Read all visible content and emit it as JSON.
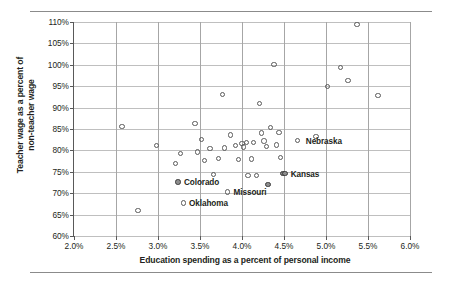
{
  "chart_data": {
    "type": "scatter",
    "title": "",
    "xlabel": "Education spending as a percent of personal income",
    "ylabel": "Teacher wage as a percent of\nnon-teacher wage",
    "xlim": [
      2.0,
      6.0
    ],
    "ylim": [
      60,
      110
    ],
    "xticks": [
      "2.0%",
      "2.5%",
      "3.0%",
      "3.5%",
      "4.0%",
      "4.5%",
      "5.0%",
      "5.5%",
      "6.0%"
    ],
    "xtick_values": [
      2.0,
      2.5,
      3.0,
      3.5,
      4.0,
      4.5,
      5.0,
      5.5,
      6.0
    ],
    "yticks": [
      "60%",
      "65%",
      "70%",
      "75%",
      "80%",
      "85%",
      "90%",
      "95%",
      "100%",
      "105%",
      "110%"
    ],
    "ytick_values": [
      60,
      65,
      70,
      75,
      80,
      85,
      90,
      95,
      100,
      105,
      110
    ],
    "grid": "both",
    "legend": "none",
    "marker": "open-circle",
    "points": [
      {
        "x": 2.57,
        "y": 85.6
      },
      {
        "x": 2.76,
        "y": 65.9
      },
      {
        "x": 2.98,
        "y": 81.2
      },
      {
        "x": 3.21,
        "y": 76.9
      },
      {
        "x": 3.24,
        "y": 72.6,
        "highlight": true
      },
      {
        "x": 3.27,
        "y": 79.3
      },
      {
        "x": 3.3,
        "y": 67.7
      },
      {
        "x": 3.44,
        "y": 86.3
      },
      {
        "x": 3.47,
        "y": 79.6
      },
      {
        "x": 3.52,
        "y": 82.6
      },
      {
        "x": 3.55,
        "y": 77.6
      },
      {
        "x": 3.62,
        "y": 80.4
      },
      {
        "x": 3.66,
        "y": 74.3
      },
      {
        "x": 3.72,
        "y": 78.1
      },
      {
        "x": 3.77,
        "y": 93.0
      },
      {
        "x": 3.79,
        "y": 80.6
      },
      {
        "x": 3.83,
        "y": 70.3
      },
      {
        "x": 3.86,
        "y": 83.6
      },
      {
        "x": 3.92,
        "y": 81.1
      },
      {
        "x": 3.96,
        "y": 77.9
      },
      {
        "x": 4.0,
        "y": 81.6
      },
      {
        "x": 4.02,
        "y": 80.8
      },
      {
        "x": 4.05,
        "y": 81.9
      },
      {
        "x": 4.07,
        "y": 74.1
      },
      {
        "x": 4.11,
        "y": 78.0
      },
      {
        "x": 4.14,
        "y": 81.8
      },
      {
        "x": 4.17,
        "y": 74.2
      },
      {
        "x": 4.21,
        "y": 91.0
      },
      {
        "x": 4.23,
        "y": 84.1
      },
      {
        "x": 4.26,
        "y": 82.2
      },
      {
        "x": 4.29,
        "y": 80.9
      },
      {
        "x": 4.31,
        "y": 72.0,
        "highlight": true
      },
      {
        "x": 4.34,
        "y": 85.4
      },
      {
        "x": 4.38,
        "y": 100.1
      },
      {
        "x": 4.41,
        "y": 81.3
      },
      {
        "x": 4.44,
        "y": 84.2
      },
      {
        "x": 4.46,
        "y": 78.3
      },
      {
        "x": 4.49,
        "y": 74.6,
        "highlight": true
      },
      {
        "x": 4.51,
        "y": 74.6,
        "highlight": true
      },
      {
        "x": 4.66,
        "y": 82.3
      },
      {
        "x": 4.88,
        "y": 83.3
      },
      {
        "x": 5.02,
        "y": 95.0
      },
      {
        "x": 5.17,
        "y": 99.4
      },
      {
        "x": 5.26,
        "y": 96.3
      },
      {
        "x": 5.37,
        "y": 109.4
      },
      {
        "x": 5.62,
        "y": 92.9
      }
    ],
    "annotations": [
      {
        "label": "Nebraska",
        "marker_x": 4.66,
        "marker_y": 82.3,
        "label_x": 4.76,
        "label_y": 82.3
      },
      {
        "label": "Kansas",
        "marker_x": 4.51,
        "marker_y": 74.6,
        "label_x": 4.58,
        "label_y": 74.6
      },
      {
        "label": "Colorado",
        "marker_x": 3.24,
        "marker_y": 72.6,
        "label_x": 3.31,
        "label_y": 72.6
      },
      {
        "label": "Missouri",
        "marker_x": 3.83,
        "marker_y": 70.3,
        "label_x": 3.9,
        "label_y": 70.3
      },
      {
        "label": "Oklahoma",
        "marker_x": 3.3,
        "marker_y": 67.7,
        "label_x": 3.37,
        "label_y": 67.7
      }
    ]
  }
}
